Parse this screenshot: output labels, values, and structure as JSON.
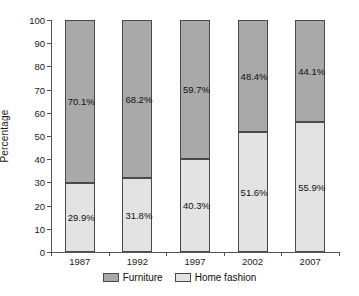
{
  "chart_data": {
    "type": "bar",
    "subtype": "stacked-100-percent",
    "title": "",
    "xlabel": "",
    "ylabel": "Percentage",
    "categories": [
      "1987",
      "1992",
      "1997",
      "2002",
      "2007"
    ],
    "ylim": [
      0,
      100
    ],
    "yticks": [
      0,
      10,
      20,
      30,
      40,
      50,
      60,
      70,
      80,
      90,
      100
    ],
    "ytick_labels": [
      "0",
      "10",
      "20",
      "30",
      "40",
      "50",
      "60",
      "70",
      "80",
      "90",
      "100"
    ],
    "grid": false,
    "legend_position": "bottom",
    "series": [
      {
        "name": "Furniture",
        "color": "#a9a9a9",
        "values": [
          70.1,
          68.2,
          59.7,
          48.4,
          44.1
        ],
        "labels": [
          "70.1%",
          "68.2%",
          "59.7%",
          "48.4%",
          "44.1%"
        ]
      },
      {
        "name": "Home fashion",
        "color": "#e3e3e3",
        "values": [
          29.9,
          31.8,
          40.3,
          51.6,
          55.9
        ],
        "labels": [
          "29.9%",
          "31.8%",
          "40.3%",
          "51.6%",
          "55.9%"
        ]
      }
    ]
  },
  "legend": {
    "items": [
      {
        "label": "Furniture",
        "swatch": "furniture"
      },
      {
        "label": "Home fashion",
        "swatch": "home"
      }
    ]
  }
}
